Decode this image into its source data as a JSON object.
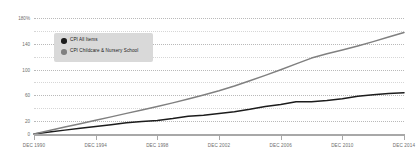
{
  "chart_data": {
    "type": "line",
    "title": "",
    "subtitle": "",
    "xlabel": "",
    "ylabel": "",
    "ylim": [
      0,
      180
    ],
    "yunit": "%",
    "grid": true,
    "legend_position": "upper-left-inside",
    "yticks": [
      {
        "value": 180,
        "label": "180%"
      },
      {
        "value": 140,
        "label": "140"
      },
      {
        "value": 100,
        "label": "100"
      },
      {
        "value": 60,
        "label": "60"
      },
      {
        "value": 20,
        "label": "20"
      },
      {
        "value": 0,
        "label": "0"
      }
    ],
    "minor_gridlines": [
      160,
      120,
      80,
      40
    ],
    "xticks": [
      {
        "value": 1990,
        "label": "DEC 1990"
      },
      {
        "value": 1994,
        "label": "DEC 1994"
      },
      {
        "value": 1998,
        "label": "DEC 1998"
      },
      {
        "value": 2002,
        "label": "DEC 2002"
      },
      {
        "value": 2006,
        "label": "DEC 2006"
      },
      {
        "value": 2010,
        "label": "DEC 2010"
      },
      {
        "value": 2014,
        "label": "DEC 2014"
      }
    ],
    "xlim": [
      1990,
      2014
    ],
    "x": [
      1990,
      1991,
      1992,
      1993,
      1994,
      1995,
      1996,
      1997,
      1998,
      1999,
      2000,
      2001,
      2002,
      2003,
      2004,
      2005,
      2006,
      2007,
      2008,
      2009,
      2010,
      2011,
      2012,
      2013,
      2014
    ],
    "series": [
      {
        "name": "CPI All Items",
        "color": "#1c1c1c",
        "marker": "circle",
        "values": [
          0,
          3.1,
          6.0,
          9.0,
          11.6,
          14.4,
          17.4,
          19.4,
          21.0,
          23.9,
          27.4,
          29.2,
          31.8,
          34.7,
          38.3,
          42.5,
          45.8,
          50.1,
          50.2,
          52.1,
          54.6,
          58.5,
          60.9,
          63.0,
          64.1
        ]
      },
      {
        "name": "CPI Childcare & Nursery School",
        "color": "#808080",
        "marker": "circle",
        "values": [
          0,
          5.5,
          10.8,
          16.0,
          21.3,
          26.6,
          32.0,
          37.2,
          42.6,
          48.3,
          54.2,
          60.4,
          67.1,
          74.4,
          82.6,
          91.0,
          99.6,
          108.8,
          117.8,
          124.4,
          130.4,
          136.6,
          143.3,
          150.4,
          157.6
        ]
      }
    ]
  },
  "legend": {
    "items": [
      {
        "label": "CPI All Items",
        "color": "#1c1c1c"
      },
      {
        "label": "CPI Childcare & Nursery School",
        "color": "#808080"
      }
    ]
  }
}
